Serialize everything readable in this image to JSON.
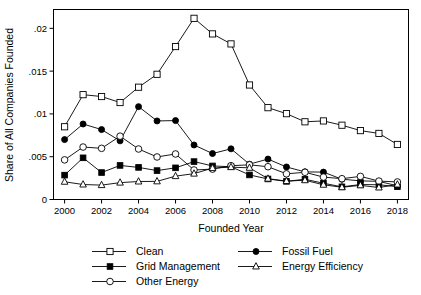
{
  "chart_data": {
    "type": "line",
    "title": "",
    "subtitle": "",
    "xlabel": "Founded Year",
    "ylabel": "Share of All Companies Founded",
    "x": [
      2000,
      2001,
      2002,
      2003,
      2004,
      2005,
      2006,
      2007,
      2008,
      2009,
      2010,
      2011,
      2012,
      2013,
      2014,
      2015,
      2016,
      2017,
      2018
    ],
    "xtick_labels": [
      "2000",
      "2002",
      "2004",
      "2006",
      "2008",
      "2010",
      "2012",
      "2014",
      "2016",
      "2018"
    ],
    "xticks": [
      2000,
      2002,
      2004,
      2006,
      2008,
      2010,
      2012,
      2014,
      2016,
      2018
    ],
    "ytick_labels": [
      "0",
      ".005",
      ".01",
      ".015",
      ".02"
    ],
    "yticks": [
      0,
      0.005,
      0.01,
      0.015,
      0.02
    ],
    "xlim": [
      1999.4,
      2018.6
    ],
    "ylim": [
      0,
      0.0222
    ],
    "grid": false,
    "legend_position": "bottom",
    "series": [
      {
        "name": "Clean",
        "marker": "open-square",
        "values": [
          0.0085,
          0.01225,
          0.01203,
          0.01133,
          0.01312,
          0.01463,
          0.01787,
          0.02117,
          0.01935,
          0.01818,
          0.01338,
          0.01073,
          0.01003,
          0.00908,
          0.00918,
          0.00868,
          0.00805,
          0.00772,
          0.00643
        ]
      },
      {
        "name": "Fossil Fuel",
        "marker": "filled-circle",
        "values": [
          0.007,
          0.00882,
          0.00817,
          0.00685,
          0.01085,
          0.00918,
          0.00922,
          0.00637,
          0.00537,
          0.00592,
          0.00413,
          0.00472,
          0.0038,
          0.00323,
          0.0032,
          0.00237,
          0.00218,
          0.00212,
          0.0016
        ]
      },
      {
        "name": "Grid Management",
        "marker": "filled-square",
        "values": [
          0.00285,
          0.00487,
          0.00315,
          0.00398,
          0.00375,
          0.00338,
          0.0037,
          0.00443,
          0.00392,
          0.00383,
          0.00287,
          0.0024,
          0.00212,
          0.00237,
          0.0019,
          0.00148,
          0.00175,
          0.00172,
          0.0015
        ]
      },
      {
        "name": "Other Energy",
        "marker": "open-circle",
        "values": [
          0.00463,
          0.00613,
          0.00598,
          0.0074,
          0.0059,
          0.00497,
          0.00532,
          0.00345,
          0.00355,
          0.00395,
          0.00405,
          0.00383,
          0.003,
          0.00318,
          0.00262,
          0.00243,
          0.0027,
          0.00215,
          0.00205
        ]
      },
      {
        "name": "Energy Efficiency",
        "marker": "open-triangle",
        "values": [
          0.00207,
          0.00175,
          0.00168,
          0.00197,
          0.0021,
          0.00212,
          0.00273,
          0.00302,
          0.00367,
          0.00378,
          0.0037,
          0.00243,
          0.00215,
          0.00225,
          0.00172,
          0.00143,
          0.00165,
          0.0014,
          0.00175
        ]
      }
    ]
  },
  "legend": {
    "entries": [
      {
        "label": "Clean",
        "marker": "open-square"
      },
      {
        "label": "Fossil Fuel",
        "marker": "filled-circle"
      },
      {
        "label": "Grid Management",
        "marker": "filled-square"
      },
      {
        "label": "Energy Efficiency",
        "marker": "open-triangle"
      },
      {
        "label": "Other Energy",
        "marker": "open-circle"
      }
    ]
  },
  "style": {
    "ink": "#000000",
    "background": "#ffffff"
  }
}
